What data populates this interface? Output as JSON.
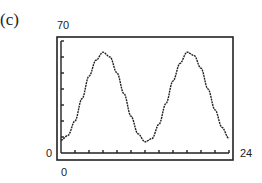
{
  "panel_label": "(c)",
  "axes": {
    "ymax_label": "70",
    "ymin_label": "0",
    "xmin_label": "0",
    "xmax_label": "24"
  },
  "chart_data": {
    "type": "line",
    "title": "",
    "xlabel": "",
    "ylabel": "",
    "xlim": [
      0,
      24
    ],
    "ylim": [
      0,
      70
    ],
    "x_ticks": 12,
    "y_ticks": 7,
    "grid": false,
    "x": [
      0,
      1,
      2,
      3,
      4,
      5,
      6,
      7,
      8,
      9,
      10,
      11,
      12,
      13,
      14,
      15,
      16,
      17,
      18,
      19,
      20,
      21,
      22,
      23,
      24
    ],
    "values": [
      8,
      11,
      20,
      34,
      48,
      58,
      63,
      60,
      50,
      37,
      23,
      12,
      7,
      9,
      18,
      31,
      45,
      56,
      63,
      61,
      53,
      40,
      27,
      16,
      9
    ]
  }
}
